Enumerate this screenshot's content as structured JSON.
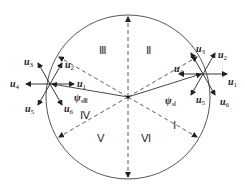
{
  "diagram": {
    "type": "voltage-vector-sector-diagram",
    "circle": {
      "cx": 128,
      "cy": 97,
      "r": 82
    },
    "sectors": [
      {
        "label": "Ⅰ",
        "x": 173,
        "y": 120
      },
      {
        "label": "Ⅱ",
        "x": 146,
        "y": 45
      },
      {
        "label": "Ⅲ",
        "x": 101,
        "y": 45
      },
      {
        "label": "Ⅳ",
        "x": 79,
        "y": 112
      },
      {
        "label": "Ⅴ",
        "x": 97,
        "y": 133
      },
      {
        "label": "Ⅵ",
        "x": 142,
        "y": 133
      }
    ],
    "left_star": {
      "center": [
        50,
        84
      ],
      "flux_label": "ψ",
      "flux_sub": "sⅢ",
      "vectors": [
        {
          "name": "u",
          "sub": "1"
        },
        {
          "name": "u",
          "sub": "2"
        },
        {
          "name": "u",
          "sub": "3"
        },
        {
          "name": "u",
          "sub": "4"
        },
        {
          "name": "u",
          "sub": "5"
        },
        {
          "name": "u",
          "sub": "6"
        }
      ]
    },
    "right_star": {
      "center": [
        203,
        74
      ],
      "flux_label": "ψ",
      "flux_sub": "sⅠ",
      "vectors": [
        {
          "name": "u",
          "sub": "1"
        },
        {
          "name": "u",
          "sub": "2"
        },
        {
          "name": "u",
          "sub": "3"
        },
        {
          "name": "u",
          "sub": "4"
        },
        {
          "name": "u",
          "sub": "5"
        },
        {
          "name": "u",
          "sub": "6"
        }
      ]
    },
    "colors": {
      "line": "#333333",
      "text": "#222222",
      "background": "#ffffff"
    }
  }
}
